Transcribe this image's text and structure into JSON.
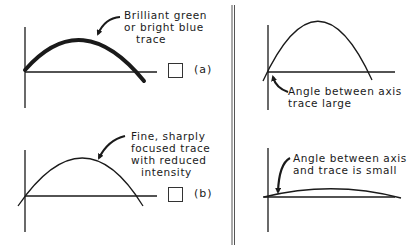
{
  "figure": {
    "panels": [
      {
        "id": "a",
        "tag": "(a)",
        "annotation": [
          "Brilliant green",
          "or bright blue",
          "trace"
        ],
        "trace_style": "thick"
      },
      {
        "id": "b",
        "tag": "(b)",
        "annotation": [
          "Fine, sharply",
          "focused trace",
          "with reduced",
          "intensity"
        ],
        "trace_style": "thin"
      },
      {
        "id": "c",
        "annotation": [
          "Angle between axis",
          "trace large"
        ],
        "trace_style": "steep"
      },
      {
        "id": "d",
        "annotation": [
          "Angle between axis",
          "and trace is small"
        ],
        "trace_style": "flat"
      }
    ],
    "colors": {
      "ink": "#1a1a1a",
      "background": "#ffffff",
      "divider": "#555555"
    }
  }
}
